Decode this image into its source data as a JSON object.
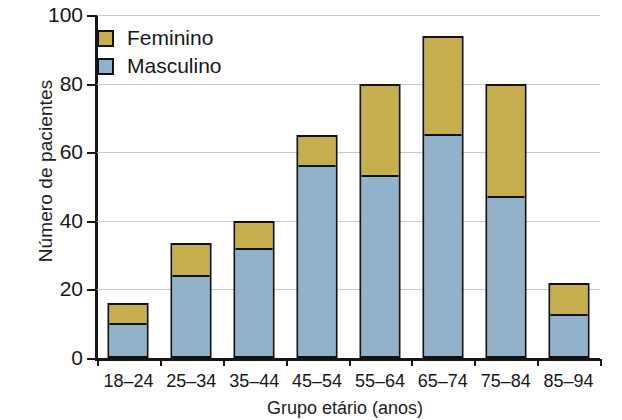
{
  "chart_data": {
    "type": "bar",
    "subtype": "stacked-vertical",
    "title": "",
    "xlabel": "Grupo etário (anos)",
    "ylabel": "Número de pacientes",
    "categories": [
      "18–24",
      "25–34",
      "35–44",
      "45–54",
      "55–64",
      "65–74",
      "75–84",
      "85–94"
    ],
    "series": [
      {
        "name": "Masculino",
        "color": "#92b2cc",
        "values": [
          10,
          24,
          32,
          56,
          53,
          65,
          47,
          12.5
        ]
      },
      {
        "name": "Feminino",
        "color": "#c6ae4f",
        "values": [
          6,
          9.5,
          8,
          9,
          27,
          29,
          33,
          9.5
        ]
      }
    ],
    "totals": [
      16,
      33.5,
      40,
      65,
      80,
      94,
      80,
      22
    ],
    "ylim": [
      0,
      100
    ],
    "yticks": [
      0,
      20,
      40,
      60,
      80,
      100
    ],
    "ytick_labels": [
      "0",
      "20",
      "40",
      "60",
      "80",
      "100"
    ],
    "grid": "horizontal",
    "legend_position": "top-left",
    "stack_order_bottom_to_top": [
      "Masculino",
      "Feminino"
    ]
  },
  "legend": {
    "items": [
      {
        "label": "Feminino",
        "color": "#c6ae4f"
      },
      {
        "label": "Masculino",
        "color": "#92b2cc"
      }
    ]
  },
  "axes": {
    "y_title": "Número de pacientes",
    "x_title": "Grupo etário (anos)"
  }
}
